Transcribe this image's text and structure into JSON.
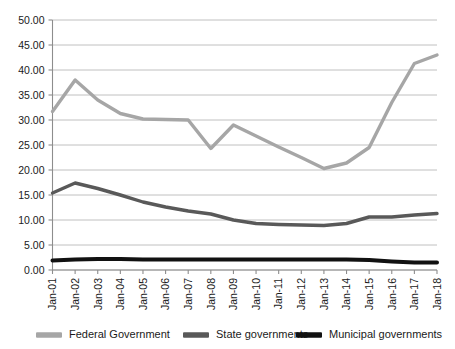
{
  "chart_data": {
    "type": "line",
    "title": "",
    "subtitle": "",
    "xlabel": "",
    "ylabel": "",
    "ylim": [
      0,
      50
    ],
    "ytick_labels": [
      "0.00",
      "5.00",
      "10.00",
      "15.00",
      "20.00",
      "25.00",
      "30.00",
      "35.00",
      "40.00",
      "45.00",
      "50.00"
    ],
    "ytick_values": [
      0,
      5,
      10,
      15,
      20,
      25,
      30,
      35,
      40,
      45,
      50
    ],
    "grid": true,
    "legend_position": "bottom",
    "categories": [
      "Jan-01",
      "Jan-02",
      "Jan-03",
      "Jan-04",
      "Jan-05",
      "Jan-06",
      "Jan-07",
      "Jan-08",
      "Jan-09",
      "Jan-10",
      "Jan-11",
      "Jan-12",
      "Jan-13",
      "Jan-14",
      "Jan-15",
      "Jan-16",
      "Jan-17",
      "Jan-18"
    ],
    "series": [
      {
        "name": "Federal Government",
        "color": "#a6a6a6",
        "values": [
          31.7,
          38.0,
          34.0,
          31.3,
          30.2,
          30.1,
          30.0,
          24.3,
          29.0,
          26.8,
          24.6,
          22.5,
          20.3,
          21.4,
          24.5,
          33.5,
          41.3,
          43.0
        ]
      },
      {
        "name": "State governments",
        "color": "#595959",
        "values": [
          15.4,
          17.4,
          16.3,
          15.0,
          13.6,
          12.6,
          11.8,
          11.2,
          10.0,
          9.3,
          9.1,
          9.0,
          8.9,
          9.3,
          10.6,
          10.6,
          11.0,
          11.3
        ]
      },
      {
        "name": "Municipal  governments",
        "color": "#111111",
        "values": [
          1.9,
          2.1,
          2.2,
          2.2,
          2.1,
          2.1,
          2.1,
          2.1,
          2.1,
          2.1,
          2.1,
          2.1,
          2.1,
          2.1,
          2.0,
          1.7,
          1.5,
          1.5
        ]
      }
    ]
  }
}
